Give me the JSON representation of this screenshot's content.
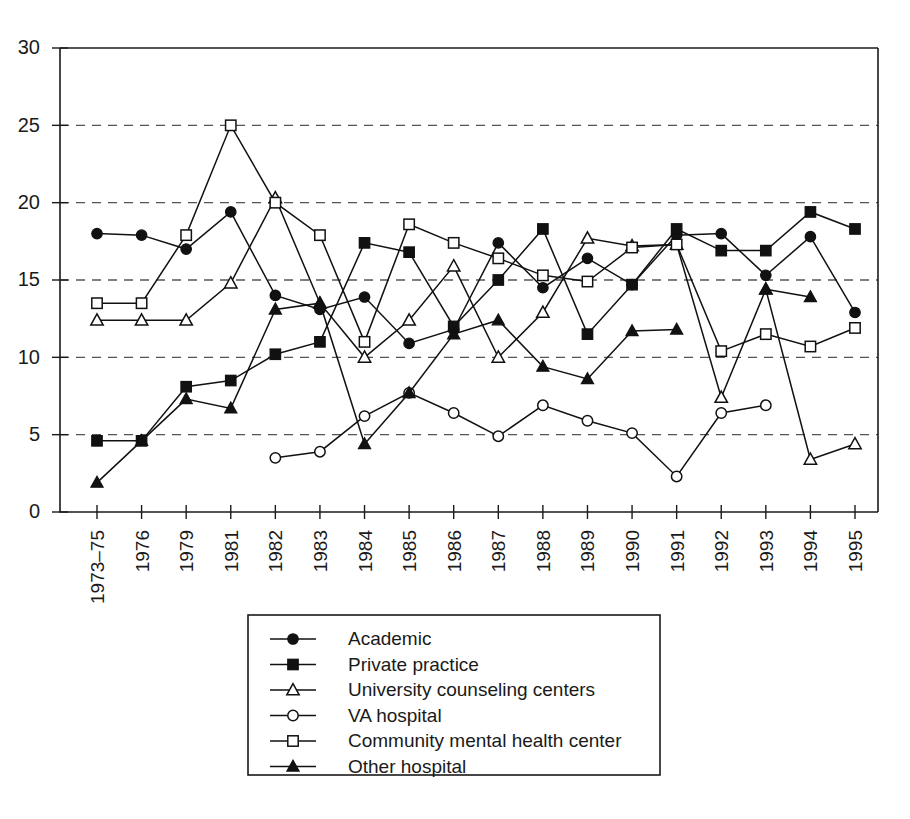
{
  "chart_data": {
    "type": "line",
    "title": "",
    "subtitle": "",
    "xlabel": "",
    "ylabel": "",
    "xlim_categories": 18,
    "ylim": [
      0,
      30
    ],
    "yticks": [
      0,
      5,
      10,
      15,
      20,
      25,
      30
    ],
    "grid": "horizontal dashed gridlines at 5,10,15,20,25",
    "legend_position": "below-plot-center",
    "categories": [
      "1973–75",
      "1976",
      "1979",
      "1981",
      "1982",
      "1983",
      "1984",
      "1985",
      "1986",
      "1987",
      "1988",
      "1989",
      "1990",
      "1991",
      "1992",
      "1993",
      "1994",
      "1995"
    ],
    "series": [
      {
        "name": "Academic",
        "marker": "filled-circle",
        "values": [
          18.0,
          17.9,
          17.0,
          19.4,
          14.0,
          13.1,
          13.9,
          10.9,
          11.8,
          17.4,
          14.5,
          16.4,
          14.7,
          17.9,
          18.0,
          15.3,
          17.8,
          12.9
        ]
      },
      {
        "name": "Private practice",
        "marker": "filled-square",
        "values": [
          4.6,
          4.6,
          8.1,
          8.5,
          10.2,
          11.0,
          17.4,
          16.8,
          12.0,
          15.0,
          18.3,
          11.5,
          14.7,
          18.3,
          16.9,
          16.9,
          19.4,
          18.3
        ]
      },
      {
        "name": "University counseling centers",
        "marker": "open-triangle",
        "values": [
          12.4,
          12.4,
          12.4,
          14.8,
          20.3,
          13.5,
          10.0,
          12.4,
          15.9,
          10.0,
          12.9,
          17.7,
          17.2,
          17.3,
          7.4,
          14.4,
          3.4,
          4.4
        ]
      },
      {
        "name": "VA hospital",
        "marker": "open-circle",
        "values": [
          null,
          null,
          null,
          null,
          3.5,
          3.9,
          6.2,
          7.7,
          6.4,
          4.9,
          6.9,
          5.9,
          5.1,
          2.3,
          6.4,
          6.9,
          null,
          null
        ]
      },
      {
        "name": "Community mental health center",
        "marker": "open-square",
        "values": [
          13.5,
          13.5,
          17.9,
          25.0,
          20.0,
          17.9,
          11.0,
          18.6,
          17.4,
          16.4,
          15.3,
          14.9,
          17.1,
          17.3,
          10.4,
          11.5,
          10.7,
          11.9
        ]
      },
      {
        "name": "Other hospital",
        "marker": "filled-triangle",
        "values": [
          1.9,
          4.6,
          7.3,
          6.7,
          13.1,
          13.5,
          4.4,
          7.7,
          11.5,
          12.4,
          9.4,
          8.6,
          11.7,
          11.8,
          null,
          14.4,
          13.9,
          null
        ]
      }
    ]
  },
  "legend": {
    "entries": [
      {
        "label": "Academic",
        "marker": "filled-circle"
      },
      {
        "label": "Private practice",
        "marker": "filled-square"
      },
      {
        "label": "University counseling centers",
        "marker": "open-triangle"
      },
      {
        "label": "VA hospital",
        "marker": "open-circle"
      },
      {
        "label": "Community mental health center",
        "marker": "open-square"
      },
      {
        "label": "Other hospital",
        "marker": "filled-triangle"
      }
    ]
  },
  "colors": {
    "ink": "#111111",
    "grid": "#555555",
    "background": "#ffffff"
  }
}
